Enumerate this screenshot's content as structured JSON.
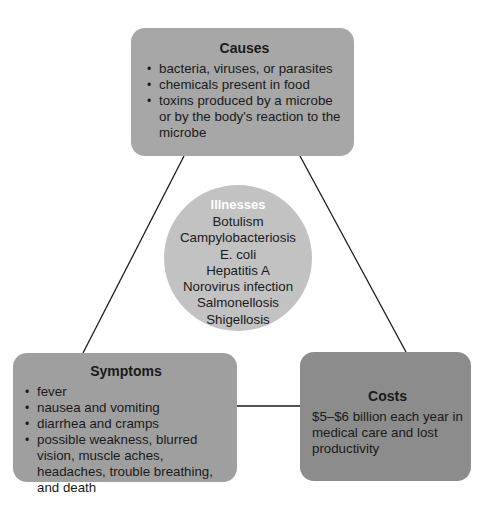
{
  "diagram": {
    "causes": {
      "title": "Causes",
      "items": [
        "bacteria, viruses, or parasites",
        "chemicals present in food",
        "toxins produced by a microbe or by the body's reaction to the microbe"
      ]
    },
    "illnesses": {
      "title": "Illnesses",
      "items": [
        "Botulism",
        "Campylobacteriosis",
        "E. coli",
        "Hepatitis A",
        "Norovirus infection",
        "Salmonellosis",
        "Shigellosis"
      ]
    },
    "symptoms": {
      "title": "Symptoms",
      "items": [
        "fever",
        "nausea and vomiting",
        "diarrhea and cramps",
        "possible weakness, blurred vision, muscle aches, headaches, trouble breathing, and death"
      ]
    },
    "costs": {
      "title": "Costs",
      "text": "$5–$6 billion each year in medical care and lost productivity"
    },
    "colors": {
      "causes_fill": "#a7a7a7",
      "symptoms_fill": "#9f9f9f",
      "costs_fill": "#8c8c8c",
      "circle_fill": "#c2c2c2",
      "connector": "#1a1a1a"
    }
  }
}
